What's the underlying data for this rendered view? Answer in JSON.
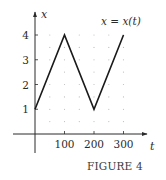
{
  "figure": {
    "caption": "FIGURE 4",
    "annotation": "x = x(t)"
  },
  "chart_data": {
    "type": "line",
    "title": "",
    "xlabel": "t",
    "ylabel": "x",
    "x": [
      0,
      100,
      200,
      300
    ],
    "series": [
      {
        "name": "x = x(t)",
        "values": [
          1,
          4,
          1,
          4
        ]
      }
    ],
    "xticks": [
      100,
      200,
      300
    ],
    "xtick_labels": [
      "100",
      "200",
      "300"
    ],
    "yticks": [
      1,
      2,
      3,
      4
    ],
    "ytick_labels": [
      "1",
      "2",
      "3",
      "4"
    ],
    "xlim": [
      -40,
      350
    ],
    "ylim": [
      -0.9,
      4.9
    ],
    "grid": "dotted",
    "grid_x_step": 50,
    "grid_y_step": 0.5,
    "annotation": "x = x(t)",
    "caption": "FIGURE 4",
    "line_color": "#1a1a1a",
    "grid_color": "#bdbdbd"
  }
}
